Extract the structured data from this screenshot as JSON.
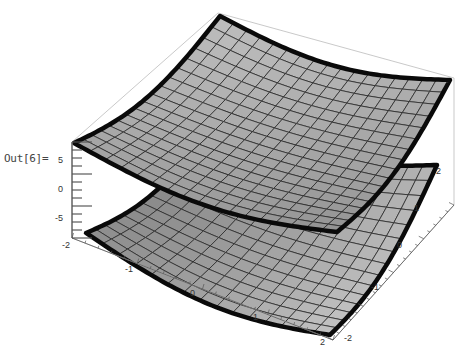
{
  "cell": {
    "output_label": "Out[6]="
  },
  "plot": {
    "type": "Plot3D",
    "surface_fill_upper": "#b4b4b4",
    "surface_fill_lower": "#8c8c8c",
    "surface_fill_lower_light": "#bdbdbd",
    "mesh_color": "#2a2a2a",
    "boundary_color": "#0a0a0a",
    "box_color": "#bbbbbb",
    "z_axis": {
      "ticks": [
        "5",
        "0",
        "-5"
      ]
    },
    "x_axis": {
      "ticks": [
        "-2",
        "-1",
        "0",
        "1",
        "2"
      ]
    },
    "y_axis": {
      "ticks": [
        "-2",
        "-1",
        "0",
        "1",
        "2"
      ]
    }
  },
  "chart_data": {
    "type": "surface3d",
    "title": "",
    "surfaces": [
      {
        "name": "upper surface",
        "shape": "bowl (concave up, corners raised)"
      },
      {
        "name": "lower surface",
        "shape": "saddle-like, corners spread"
      }
    ],
    "x_range": [
      -2,
      2
    ],
    "y_range": [
      -2,
      2
    ],
    "z_ticks": [
      5,
      0,
      -5
    ],
    "x_ticks": [
      -2,
      -1,
      0,
      1,
      2
    ],
    "y_ticks": [
      -2,
      -1,
      0,
      1,
      2
    ],
    "mesh": "15x15 grid",
    "boxed": true
  }
}
